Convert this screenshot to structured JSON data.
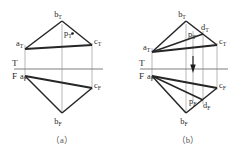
{
  "figure": {
    "background_color": "#ffffff",
    "edge_color": "#262626",
    "projector_color": "#9a9a9a",
    "ground_line_color": "#808080",
    "label_color": "#2b2b2b",
    "caption_color": "#555555"
  },
  "captions": {
    "left": "（a）",
    "right": "（b）"
  },
  "axis_labels": {
    "top_view_letter": "T",
    "front_view_letter": "F"
  },
  "panel_a": {
    "name": "panel-a",
    "ground_line": {
      "x1": 14,
      "y1": 69,
      "x2": 103,
      "y2": 69
    },
    "top_view": {
      "points": {
        "a": {
          "x": 25,
          "y": 49,
          "label": "a",
          "sub": "T"
        },
        "b": {
          "x": 62,
          "y": 21,
          "label": "b",
          "sub": "T"
        },
        "c": {
          "x": 92,
          "y": 45,
          "label": "c",
          "sub": "T"
        },
        "p": {
          "x": 67,
          "y": 37,
          "label": "p",
          "sub": "T"
        }
      },
      "edges": [
        [
          "a",
          "b"
        ],
        [
          "b",
          "c"
        ],
        [
          "c",
          "a"
        ]
      ],
      "point_marker": "p"
    },
    "front_view": {
      "points": {
        "a": {
          "x": 25,
          "y": 76,
          "label": "a",
          "sub": "F"
        },
        "b": {
          "x": 62,
          "y": 113,
          "label": "b",
          "sub": "F"
        },
        "c": {
          "x": 92,
          "y": 88,
          "label": "c",
          "sub": "F"
        }
      },
      "edges": [
        [
          "a",
          "b"
        ],
        [
          "b",
          "c"
        ],
        [
          "c",
          "a"
        ]
      ]
    },
    "projectors": [
      {
        "x": 25,
        "y1": 45,
        "y2": 80
      },
      {
        "x": 62,
        "y1": 24,
        "y2": 112
      },
      {
        "x": 92,
        "y1": 43,
        "y2": 90
      }
    ]
  },
  "panel_b": {
    "name": "panel-b",
    "ground_line": {
      "x1": 140,
      "y1": 69,
      "x2": 228,
      "y2": 69
    },
    "top_view": {
      "points": {
        "a": {
          "x": 152,
          "y": 52,
          "label": "a",
          "sub": "T"
        },
        "b": {
          "x": 186,
          "y": 21,
          "label": "b",
          "sub": "T"
        },
        "c": {
          "x": 217,
          "y": 45,
          "label": "c",
          "sub": "T"
        },
        "d": {
          "x": 203,
          "y": 34,
          "label": "d",
          "sub": "T"
        },
        "p": {
          "x": 193,
          "y": 35,
          "label": "p",
          "sub": "T"
        }
      },
      "edges": [
        [
          "a",
          "b"
        ],
        [
          "b",
          "c"
        ],
        [
          "c",
          "a"
        ]
      ],
      "construction_lines": [
        [
          "a",
          "d"
        ]
      ]
    },
    "front_view": {
      "points": {
        "a": {
          "x": 152,
          "y": 76,
          "label": "a",
          "sub": "F"
        },
        "b": {
          "x": 186,
          "y": 113,
          "label": "b",
          "sub": "F"
        },
        "c": {
          "x": 217,
          "y": 88,
          "label": "c",
          "sub": "F"
        },
        "d": {
          "x": 203,
          "y": 100,
          "label": "d",
          "sub": "F"
        },
        "p": {
          "x": 193,
          "y": 97,
          "label": "p",
          "sub": "F"
        }
      },
      "edges": [
        [
          "a",
          "b"
        ],
        [
          "b",
          "c"
        ],
        [
          "c",
          "a"
        ]
      ],
      "construction_lines": [
        [
          "a",
          "d"
        ]
      ]
    },
    "projectors": [
      {
        "x": 152,
        "y1": 48,
        "y2": 80
      },
      {
        "x": 186,
        "y1": 24,
        "y2": 112
      },
      {
        "x": 193,
        "y1": 31,
        "y2": 101
      },
      {
        "x": 203,
        "y1": 31,
        "y2": 104
      },
      {
        "x": 217,
        "y1": 43,
        "y2": 90
      }
    ],
    "arrow": {
      "name": "projection-direction-arrow",
      "x": 193,
      "y_tip": 72,
      "y_tail": 58,
      "direction": "down"
    }
  }
}
